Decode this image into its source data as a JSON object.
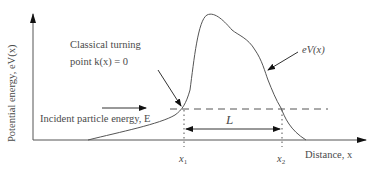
{
  "diagram": {
    "y_axis_label": "Potential energy, eV(x)",
    "x_axis_label": "Distance, x",
    "curve_label": "eV(x)",
    "turning_point_label_line1": "Classical turning",
    "turning_point_label_line2": "point k(x) = 0",
    "incident_label": "Incident particle energy, E",
    "barrier_width_label": "L",
    "x1_label": "x",
    "x1_sub": "1",
    "x2_label": "x",
    "x2_sub": "2",
    "colors": {
      "line": "#555555",
      "text": "#4a4a4a",
      "arrow": "#111111"
    }
  }
}
